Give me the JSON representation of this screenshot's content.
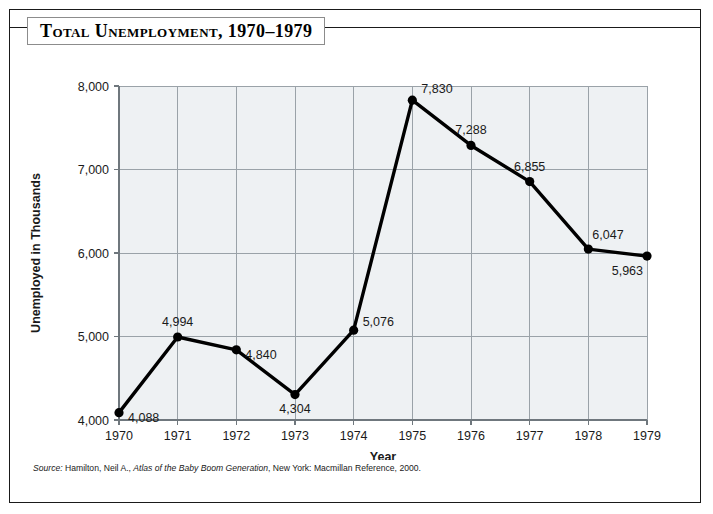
{
  "figure": {
    "title": "Total Unemployment, 1970–1979",
    "source": {
      "label": "Source:",
      "text_before_italic": " Hamilton, Neil A., ",
      "italic_title": "Atlas of the Baby Boom Generation",
      "text_after_italic": ", New York: Macmillan Reference, 2000."
    }
  },
  "chart_data": {
    "type": "line",
    "title": "Total Unemployment, 1970–1979",
    "xlabel": "Year",
    "ylabel": "Unemployed in Thousands",
    "categories": [
      "1970",
      "1971",
      "1972",
      "1973",
      "1974",
      "1975",
      "1976",
      "1977",
      "1978",
      "1979"
    ],
    "values": [
      4088,
      4994,
      4840,
      4304,
      5076,
      7830,
      7288,
      6855,
      6047,
      5963
    ],
    "point_labels": [
      "4,088",
      "4,994",
      "4,840",
      "4,304",
      "5,076",
      "7,830",
      "7,288",
      "6,855",
      "6,047",
      "5,963"
    ],
    "label_positions": [
      "right-below",
      "above",
      "right-below",
      "below",
      "right-above",
      "right",
      "above",
      "above",
      "above-right",
      "below-left"
    ],
    "ylim": [
      4000,
      8000
    ],
    "yticks": [
      4000,
      5000,
      6000,
      7000,
      8000
    ],
    "ytick_labels": [
      "4,000",
      "5,000",
      "6,000",
      "7,000",
      "8,000"
    ],
    "grid": true,
    "legend": "none",
    "marker": "filled-circle",
    "line_color": "#000000",
    "plot_background": "#eef1f3",
    "grid_color": "#9aa2a8"
  }
}
